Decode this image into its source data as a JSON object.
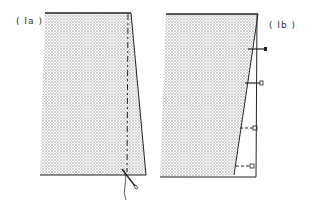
{
  "figure": {
    "panels": [
      {
        "id": "Ia",
        "label": "( Ia )",
        "description": "Fabric piece with dashed basting/stitch line near right edge, thread and needle at bottom"
      },
      {
        "id": "Ib",
        "label": "( Ib )",
        "description": "Fabric piece with tapered seam edge pinned at intervals along straight right line"
      }
    ],
    "colors": {
      "line": "#222222",
      "fabric_dots": "#9a9a9a",
      "background": "#ffffff"
    },
    "pins_count_Ib": 4
  }
}
